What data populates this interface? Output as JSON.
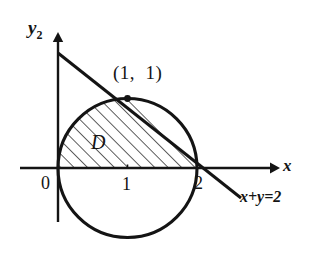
{
  "figure": {
    "kind": "math-region-diagram",
    "background_color": "#ffffff",
    "stroke_color": "#141414",
    "hatch_color": "#2a2a2a",
    "labels": {
      "y_axis": "y",
      "y_axis_subscript": "2",
      "x_axis": "x",
      "point": "(1,  1)",
      "region": "D",
      "tick_zero": "0",
      "tick_one": "1",
      "tick_two": "2",
      "line_equation": "x+y=2"
    },
    "geometry": {
      "origin_px": [
        58,
        168
      ],
      "unit_px": 69.5,
      "circle": {
        "center_data": [
          1,
          0
        ],
        "radius_data": 1,
        "center_px": [
          127.5,
          168
        ],
        "radius_px": 69.5,
        "equation": "(x-1)^2 + y^2 = 1"
      },
      "line": {
        "equation": "x+y=2",
        "through_data": [
          [
            0,
            2
          ],
          [
            1,
            1
          ],
          [
            2,
            0
          ]
        ],
        "drawn_from_px": [
          58,
          53
        ],
        "drawn_to_px": [
          241,
          198
        ]
      },
      "intersection_point_data": [
        1,
        1
      ],
      "intersection_point_px": [
        127.5,
        98.5
      ],
      "x_axis_px": {
        "from": [
          20,
          168
        ],
        "to": [
          277,
          168
        ]
      },
      "y_axis_px": {
        "from": [
          58,
          222
        ],
        "to": [
          58,
          36
        ]
      },
      "hatch_angle_deg": 45,
      "hatch_spacing_px": 9.5
    }
  }
}
